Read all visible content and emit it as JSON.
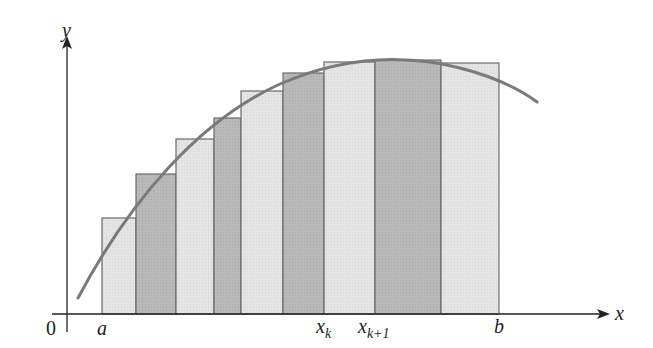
{
  "diagram": {
    "axes": {
      "x_label": "x",
      "y_label": "y",
      "origin_label": "0"
    },
    "tick_labels": {
      "a": "a",
      "xk": "x",
      "xk_sub": "k",
      "xk1": "x",
      "xk1_sub": "k+1",
      "b": "b"
    },
    "colors": {
      "light_fill": "#e4e4e4",
      "dark_fill": "#b9b9b9",
      "outline": "#6a6a6a",
      "curve": "#7a7a7a",
      "axis": "#222222"
    },
    "rectangles": [
      {
        "x0": 102,
        "x1": 136,
        "top": 218,
        "shade": "light"
      },
      {
        "x0": 136,
        "x1": 176,
        "top": 174,
        "shade": "dark"
      },
      {
        "x0": 176,
        "x1": 214,
        "top": 139,
        "shade": "light"
      },
      {
        "x0": 214,
        "x1": 241,
        "top": 118,
        "shade": "dark"
      },
      {
        "x0": 241,
        "x1": 283,
        "top": 91,
        "shade": "light"
      },
      {
        "x0": 283,
        "x1": 324,
        "top": 73,
        "shade": "dark"
      },
      {
        "x0": 324,
        "x1": 375,
        "top": 62,
        "shade": "light"
      },
      {
        "x0": 375,
        "x1": 441,
        "top": 60,
        "shade": "dark"
      },
      {
        "x0": 441,
        "x1": 499,
        "top": 63,
        "shade": "light"
      }
    ]
  }
}
